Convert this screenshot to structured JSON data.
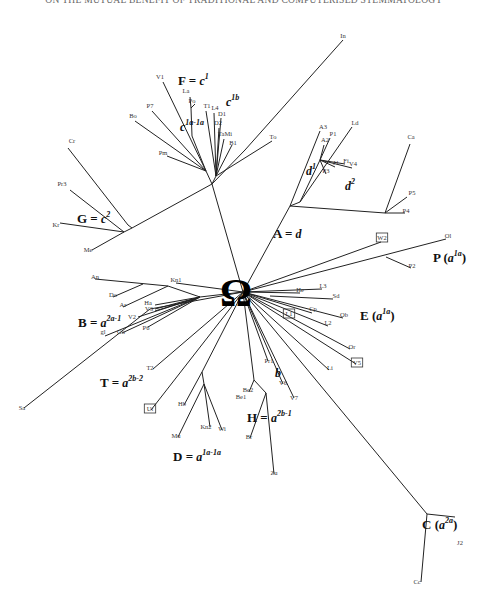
{
  "header": {
    "running_title": "ON THE MUTUAL BENEFIT OF TRADITIONAL AND COMPUTERISED STEMMATOLOGY"
  },
  "root": {
    "label": "Ω",
    "x": 243,
    "y": 292
  },
  "groups": [
    {
      "id": "F",
      "label": "F = c",
      "sup": "1",
      "x": 178,
      "y": 85
    },
    {
      "id": "c1b",
      "label": "c",
      "sup": "1b",
      "x": 226,
      "y": 106
    },
    {
      "id": "c1a1a",
      "label": "c",
      "sup": "1a-1a",
      "x": 180,
      "y": 131
    },
    {
      "id": "G",
      "label": "G = c",
      "sup": "2",
      "x": 77,
      "y": 223
    },
    {
      "id": "A",
      "label": "A = d",
      "sup": "",
      "x": 273,
      "y": 238
    },
    {
      "id": "d1",
      "label": "d",
      "sup": "1",
      "x": 306,
      "y": 175
    },
    {
      "id": "d2",
      "label": "d",
      "sup": "2",
      "x": 345,
      "y": 190
    },
    {
      "id": "P",
      "label": "P (a",
      "sup": "1a",
      "tail": ")",
      "x": 433,
      "y": 262
    },
    {
      "id": "E",
      "label": "E (a",
      "sup": "1a",
      "tail": ")",
      "x": 360,
      "y": 320
    },
    {
      "id": "B",
      "label": "B = a",
      "sup": "2a-1",
      "x": 78,
      "y": 327
    },
    {
      "id": "T",
      "label": "T = a",
      "sup": "2b-2",
      "x": 100,
      "y": 387
    },
    {
      "id": "b",
      "label": "b",
      "sup": "",
      "x": 275,
      "y": 377
    },
    {
      "id": "H",
      "label": "H = a",
      "sup": "2b-1",
      "x": 247,
      "y": 422
    },
    {
      "id": "D",
      "label": "D = a",
      "sup": "1a-1a",
      "x": 173,
      "y": 461
    },
    {
      "id": "C",
      "label": "C (a",
      "sup": "2a",
      "tail": ")",
      "x": 422,
      "y": 529
    }
  ],
  "leaves": [
    {
      "label": "In",
      "x": 343,
      "y": 38
    },
    {
      "label": "V1",
      "x": 160,
      "y": 79
    },
    {
      "label": "La",
      "x": 186,
      "y": 93
    },
    {
      "label": "Po",
      "x": 192,
      "y": 103
    },
    {
      "label": "P7",
      "x": 150,
      "y": 108
    },
    {
      "label": "T1",
      "x": 207,
      "y": 108
    },
    {
      "label": "L4",
      "x": 215,
      "y": 110
    },
    {
      "label": "D1",
      "x": 222,
      "y": 116
    },
    {
      "label": "D2",
      "x": 218,
      "y": 125
    },
    {
      "label": "TaMi",
      "x": 225,
      "y": 136
    },
    {
      "label": "B1",
      "x": 233,
      "y": 145
    },
    {
      "label": "Bo",
      "x": 133,
      "y": 118
    },
    {
      "label": "Cr",
      "x": 72,
      "y": 143
    },
    {
      "label": "Pm",
      "x": 163,
      "y": 155
    },
    {
      "label": "To",
      "x": 273,
      "y": 139
    },
    {
      "label": "A3",
      "x": 323,
      "y": 129
    },
    {
      "label": "Ld",
      "x": 355,
      "y": 125
    },
    {
      "label": "P1",
      "x": 333,
      "y": 136
    },
    {
      "label": "A2",
      "x": 325,
      "y": 142
    },
    {
      "label": "J1",
      "x": 336,
      "y": 165
    },
    {
      "label": "Fi",
      "x": 346,
      "y": 163
    },
    {
      "label": "V4",
      "x": 353,
      "y": 166
    },
    {
      "label": "P3",
      "x": 326,
      "y": 173
    },
    {
      "label": "Ca",
      "x": 411,
      "y": 139
    },
    {
      "label": "P5",
      "x": 412,
      "y": 195
    },
    {
      "label": "P4",
      "x": 406,
      "y": 213
    },
    {
      "label": "Pr3",
      "x": 62,
      "y": 186
    },
    {
      "label": "Kr",
      "x": 56,
      "y": 227
    },
    {
      "label": "Me",
      "x": 88,
      "y": 252
    },
    {
      "label": "W2",
      "x": 382,
      "y": 240,
      "boxed": true
    },
    {
      "label": "Ol",
      "x": 448,
      "y": 238
    },
    {
      "label": "P2",
      "x": 412,
      "y": 268
    },
    {
      "label": "Kn1",
      "x": 176,
      "y": 282
    },
    {
      "label": "An",
      "x": 95,
      "y": 279
    },
    {
      "label": "Do",
      "x": 113,
      "y": 297
    },
    {
      "label": "Ar",
      "x": 123,
      "y": 307
    },
    {
      "label": "Ha",
      "x": 148,
      "y": 305
    },
    {
      "label": "V3",
      "x": 149,
      "y": 311
    },
    {
      "label": "V2",
      "x": 132,
      "y": 319
    },
    {
      "label": "P6",
      "x": 146,
      "y": 330
    },
    {
      "label": "Go",
      "x": 121,
      "y": 334
    },
    {
      "label": "gl",
      "x": 103,
      "y": 334
    },
    {
      "label": "L3",
      "x": 323,
      "y": 288
    },
    {
      "label": "He",
      "x": 300,
      "y": 292
    },
    {
      "label": "Sd",
      "x": 336,
      "y": 298
    },
    {
      "label": "Cp",
      "x": 313,
      "y": 311
    },
    {
      "label": "Ob",
      "x": 344,
      "y": 317
    },
    {
      "label": "L2",
      "x": 328,
      "y": 325
    },
    {
      "label": "L1",
      "x": 289,
      "y": 316,
      "boxed": true
    },
    {
      "label": "Or",
      "x": 352,
      "y": 349
    },
    {
      "label": "V5",
      "x": 357,
      "y": 365,
      "boxed": true
    },
    {
      "label": "Li",
      "x": 330,
      "y": 370
    },
    {
      "label": "T2",
      "x": 150,
      "y": 370
    },
    {
      "label": "Pr1",
      "x": 269,
      "y": 363
    },
    {
      "label": "V6",
      "x": 283,
      "y": 385
    },
    {
      "label": "V7",
      "x": 294,
      "y": 400
    },
    {
      "label": "Be2",
      "x": 248,
      "y": 392
    },
    {
      "label": "Be1",
      "x": 241,
      "y": 399
    },
    {
      "label": "Sa",
      "x": 22,
      "y": 410
    },
    {
      "label": "Ut",
      "x": 150,
      "y": 411,
      "boxed": true
    },
    {
      "label": "Hb",
      "x": 182,
      "y": 406
    },
    {
      "label": "Kn2",
      "x": 206,
      "y": 429
    },
    {
      "label": "Wi",
      "x": 222,
      "y": 431
    },
    {
      "label": "Mu",
      "x": 176,
      "y": 438
    },
    {
      "label": "Br",
      "x": 249,
      "y": 439
    },
    {
      "label": "Zu",
      "x": 274,
      "y": 475
    },
    {
      "label": "J2",
      "x": 460,
      "y": 545
    },
    {
      "label": "Cc",
      "x": 417,
      "y": 584
    }
  ],
  "edges": [
    [
      243,
      292,
      212,
      184
    ],
    [
      212,
      184,
      245,
      150
    ],
    [
      245,
      150,
      343,
      40
    ],
    [
      212,
      184,
      132,
      228
    ],
    [
      132,
      228,
      128,
      225
    ],
    [
      128,
      225,
      68,
      148
    ],
    [
      132,
      228,
      124,
      232
    ],
    [
      124,
      232,
      70,
      190
    ],
    [
      124,
      232,
      60,
      223
    ],
    [
      124,
      232,
      92,
      250
    ],
    [
      212,
      184,
      206,
      171
    ],
    [
      206,
      171,
      135,
      121
    ],
    [
      206,
      171,
      152,
      111
    ],
    [
      206,
      171,
      167,
      156
    ],
    [
      206,
      171,
      163,
      82
    ],
    [
      206,
      171,
      192,
      136
    ],
    [
      192,
      136,
      191,
      108
    ],
    [
      191,
      108,
      195,
      104
    ],
    [
      191,
      108,
      190,
      97
    ],
    [
      212,
      184,
      216,
      176
    ],
    [
      216,
      176,
      206,
      111
    ],
    [
      216,
      176,
      214,
      113
    ],
    [
      216,
      176,
      221,
      118
    ],
    [
      216,
      176,
      219,
      128
    ],
    [
      216,
      176,
      224,
      139
    ],
    [
      216,
      176,
      232,
      145
    ],
    [
      216,
      176,
      272,
      141
    ],
    [
      243,
      292,
      290,
      206
    ],
    [
      290,
      206,
      320,
      131
    ],
    [
      290,
      206,
      300,
      202
    ],
    [
      300,
      202,
      352,
      127
    ],
    [
      300,
      202,
      320,
      160
    ],
    [
      320,
      160,
      330,
      138
    ],
    [
      320,
      160,
      324,
      145
    ],
    [
      320,
      160,
      335,
      167
    ],
    [
      320,
      160,
      345,
      164
    ],
    [
      320,
      160,
      352,
      168
    ],
    [
      320,
      160,
      326,
      174
    ],
    [
      290,
      206,
      385,
      213
    ],
    [
      385,
      213,
      410,
      144
    ],
    [
      385,
      213,
      407,
      197
    ],
    [
      385,
      213,
      405,
      213
    ],
    [
      243,
      292,
      381,
      242
    ],
    [
      243,
      292,
      446,
      239
    ],
    [
      386,
      257,
      411,
      268
    ],
    [
      243,
      292,
      322,
      289
    ],
    [
      243,
      292,
      300,
      293
    ],
    [
      270,
      296,
      333,
      299
    ],
    [
      243,
      292,
      312,
      313
    ],
    [
      243,
      292,
      343,
      318
    ],
    [
      243,
      292,
      328,
      326
    ],
    [
      243,
      292,
      350,
      349
    ],
    [
      243,
      292,
      356,
      364
    ],
    [
      243,
      292,
      329,
      370
    ],
    [
      243,
      292,
      176,
      283
    ],
    [
      243,
      292,
      200,
      297
    ],
    [
      200,
      297,
      168,
      286
    ],
    [
      168,
      286,
      95,
      279
    ],
    [
      143,
      284,
      113,
      297
    ],
    [
      168,
      286,
      123,
      307
    ],
    [
      200,
      297,
      155,
      305
    ],
    [
      200,
      297,
      155,
      309
    ],
    [
      200,
      297,
      155,
      311
    ],
    [
      200,
      297,
      138,
      317
    ],
    [
      200,
      297,
      148,
      327
    ],
    [
      200,
      297,
      122,
      333
    ],
    [
      200,
      297,
      105,
      336
    ],
    [
      243,
      292,
      153,
      369
    ],
    [
      243,
      292,
      150,
      309
    ],
    [
      150,
      309,
      24,
      408
    ],
    [
      243,
      292,
      151,
      410
    ],
    [
      243,
      292,
      202,
      372
    ],
    [
      202,
      372,
      184,
      405
    ],
    [
      202,
      372,
      204,
      384
    ],
    [
      204,
      384,
      178,
      437
    ],
    [
      204,
      384,
      210,
      427
    ],
    [
      204,
      384,
      222,
      430
    ],
    [
      243,
      292,
      254,
      380
    ],
    [
      254,
      380,
      249,
      392
    ],
    [
      254,
      380,
      266,
      393
    ],
    [
      266,
      393,
      250,
      438
    ],
    [
      266,
      393,
      274,
      474
    ],
    [
      243,
      292,
      268,
      361
    ],
    [
      243,
      292,
      283,
      384
    ],
    [
      243,
      292,
      294,
      398
    ],
    [
      243,
      292,
      427,
      514
    ],
    [
      427,
      514,
      455,
      517
    ],
    [
      427,
      514,
      421,
      582
    ]
  ]
}
